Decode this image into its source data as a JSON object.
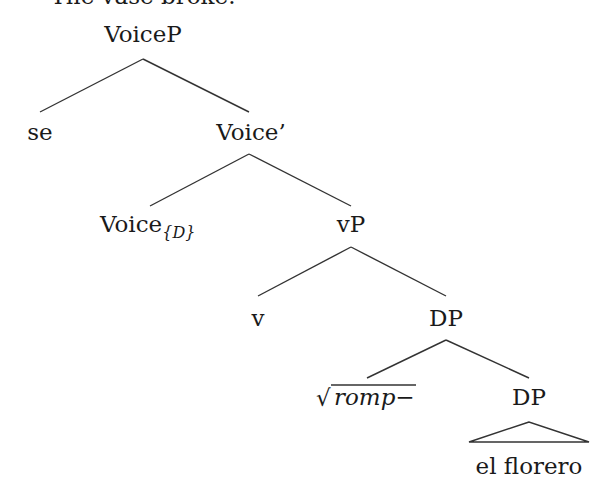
{
  "caption": "The vase broke.",
  "tree": {
    "root": "VoiceP",
    "nodes": {
      "voicep": "VoiceP",
      "se": "se",
      "voice_bar": "Voice’",
      "voice_head": "Voice",
      "voice_head_sub": "{D}",
      "vp": "vP",
      "v": "v",
      "dp_upper": "DP",
      "root_sym": "√",
      "root_morph": "romp−",
      "dp_lower": "DP",
      "dp_lower_content": "el florero"
    },
    "edges": [
      [
        "VoiceP",
        "se"
      ],
      [
        "VoiceP",
        "Voice’"
      ],
      [
        "Voice’",
        "Voice{D}"
      ],
      [
        "Voice’",
        "vP"
      ],
      [
        "vP",
        "v"
      ],
      [
        "vP",
        "DP"
      ],
      [
        "DP",
        "√romp−"
      ],
      [
        "DP",
        "DP"
      ]
    ],
    "triangle_under": "DP (el florero)"
  }
}
